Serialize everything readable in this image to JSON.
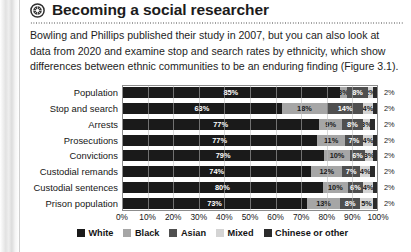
{
  "page": {
    "header": {
      "icon": "globe-emblem-icon",
      "title": "Becoming a social researcher"
    },
    "body_text": "Bowling and Phillips published their study in 2007, but you can also look at data from 2020 and examine stop and search rates by ethnicity, which show differences between ethnic communities to be an enduring finding (Figure 3.1)."
  },
  "chart_data": {
    "type": "bar",
    "orientation": "horizontal",
    "stacked": true,
    "normalized_percent": true,
    "title": "",
    "xlabel": "",
    "ylabel": "",
    "xlim": [
      0,
      100
    ],
    "grid": true,
    "legend_position": "bottom",
    "categories": [
      "Population",
      "Stop and search",
      "Arrests",
      "Prosecutions",
      "Convictions",
      "Custodial remands",
      "Custodial sentences",
      "Prison population"
    ],
    "series": [
      {
        "name": "White",
        "color": "#1a1a1a",
        "values": [
          85,
          63,
          77,
          77,
          79,
          74,
          80,
          73
        ]
      },
      {
        "name": "Black",
        "color": "#a6a6a6",
        "values": [
          3,
          18,
          9,
          11,
          10,
          12,
          10,
          13
        ]
      },
      {
        "name": "Asian",
        "color": "#4f4f4f",
        "values": [
          8,
          14,
          8,
          7,
          6,
          7,
          6,
          8
        ]
      },
      {
        "name": "Mixed",
        "color": "#d4d4d4",
        "values": [
          2,
          4,
          3,
          4,
          3,
          4,
          4,
          5
        ]
      },
      {
        "name": "Chinese or other",
        "color": "#2b2b2b",
        "values": [
          2,
          2,
          2,
          2,
          2,
          2,
          2,
          2
        ]
      }
    ],
    "value_labels": [
      [
        "85%",
        "3%",
        "8%",
        "2%",
        "2%"
      ],
      [
        "63%",
        "18%",
        "14%",
        "4%",
        "2%"
      ],
      [
        "77%",
        "9%",
        "8%",
        "3%",
        "2%"
      ],
      [
        "77%",
        "11%",
        "7%",
        "4%",
        "2%"
      ],
      [
        "79%",
        "10%",
        "6%",
        "3%",
        "2%"
      ],
      [
        "74%",
        "12%",
        "7%",
        "4%",
        "2%"
      ],
      [
        "80%",
        "10%",
        "6%",
        "4%",
        "2%"
      ],
      [
        "73%",
        "13%",
        "8%",
        "5%",
        "2%"
      ]
    ],
    "xticks": [
      "0%",
      "10%",
      "20%",
      "30%",
      "40%",
      "50%",
      "60%",
      "70%",
      "80%",
      "90%",
      "100%"
    ],
    "xtick_values": [
      0,
      10,
      20,
      30,
      40,
      50,
      60,
      70,
      80,
      90,
      100
    ],
    "legend": [
      "White",
      "Black",
      "Asian",
      "Mixed",
      "Chinese or other"
    ]
  }
}
